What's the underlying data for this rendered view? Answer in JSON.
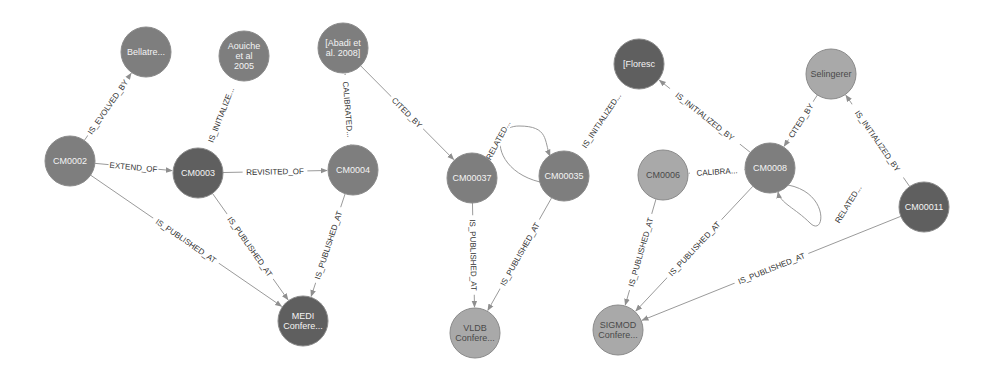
{
  "graph": {
    "colors": {
      "dark": "#5f5f5f",
      "medium": "#7e7e7e",
      "light": "#a9a9a9",
      "edge": "#9a9a9a",
      "edge_label": "#333333"
    },
    "nodes": [
      {
        "id": "n_bellatreche",
        "label_lines": [
          "Bellatre..."
        ],
        "x": 146,
        "y": 52,
        "r": 25,
        "shade": "medium"
      },
      {
        "id": "n_aouiche",
        "label_lines": [
          "Aouiche",
          "et al",
          "2005"
        ],
        "x": 244,
        "y": 56,
        "r": 25,
        "shade": "medium"
      },
      {
        "id": "n_abadi",
        "label_lines": [
          "[Abadi et",
          "al. 2008]"
        ],
        "x": 343,
        "y": 48,
        "r": 25,
        "shade": "medium"
      },
      {
        "id": "n_floresc",
        "label_lines": [
          "[Floresc"
        ],
        "x": 639,
        "y": 64,
        "r": 25,
        "shade": "dark"
      },
      {
        "id": "n_selingerer",
        "label_lines": [
          "Selingerer"
        ],
        "x": 831,
        "y": 74,
        "r": 25,
        "shade": "light"
      },
      {
        "id": "n_cm0002",
        "label_lines": [
          "CM0002"
        ],
        "x": 70,
        "y": 161,
        "r": 25,
        "shade": "medium"
      },
      {
        "id": "n_cm0003",
        "label_lines": [
          "CM0003"
        ],
        "x": 198,
        "y": 173,
        "r": 25,
        "shade": "dark"
      },
      {
        "id": "n_cm0004",
        "label_lines": [
          "CM0004"
        ],
        "x": 353,
        "y": 170,
        "r": 25,
        "shade": "medium"
      },
      {
        "id": "n_cm00037",
        "label_lines": [
          "CM00037"
        ],
        "x": 472,
        "y": 178,
        "r": 25,
        "shade": "medium"
      },
      {
        "id": "n_cm00035",
        "label_lines": [
          "CM00035"
        ],
        "x": 564,
        "y": 176,
        "r": 25,
        "shade": "medium"
      },
      {
        "id": "n_cm0006",
        "label_lines": [
          "CM0006"
        ],
        "x": 663,
        "y": 175,
        "r": 25,
        "shade": "light"
      },
      {
        "id": "n_cm0008",
        "label_lines": [
          "CM0008"
        ],
        "x": 770,
        "y": 168,
        "r": 25,
        "shade": "medium"
      },
      {
        "id": "n_cm00011",
        "label_lines": [
          "CM00011"
        ],
        "x": 924,
        "y": 207,
        "r": 25,
        "shade": "dark"
      },
      {
        "id": "n_medi",
        "label_lines": [
          "MEDI",
          "Confere..."
        ],
        "x": 303,
        "y": 321,
        "r": 25,
        "shade": "dark"
      },
      {
        "id": "n_vldb",
        "label_lines": [
          "VLDB",
          "Confere..."
        ],
        "x": 475,
        "y": 333,
        "r": 25,
        "shade": "light"
      },
      {
        "id": "n_sigmod",
        "label_lines": [
          "SIGMOD",
          "Confere..."
        ],
        "x": 618,
        "y": 330,
        "r": 25,
        "shade": "light"
      }
    ],
    "edges": [
      {
        "from": "n_cm0002",
        "to": "n_bellatreche",
        "label": "IS_EVOLVED_BY"
      },
      {
        "from": "n_cm0002",
        "to": "n_cm0003",
        "label": "EXTEND_OF"
      },
      {
        "from": "n_cm0002",
        "to": "n_medi",
        "label": "IS_PUBLISHED_AT"
      },
      {
        "from": "n_cm0003",
        "to": "n_aouiche",
        "label": "IS_INITIALIZE..."
      },
      {
        "from": "n_cm0003",
        "to": "n_cm0004",
        "label": "REVISITED_OF"
      },
      {
        "from": "n_cm0003",
        "to": "n_medi",
        "label": "IS_PUBLISHED_AT"
      },
      {
        "from": "n_cm0004",
        "to": "n_abadi",
        "label": "CALIBRATED..."
      },
      {
        "from": "n_cm0004",
        "to": "n_medi",
        "label": "IS_PUBLISHED_AT"
      },
      {
        "from": "n_abadi",
        "to": "n_cm00037",
        "label": "CITED_BY"
      },
      {
        "from": "n_cm00037",
        "to": "n_cm00035",
        "label": "RELATED...",
        "curve": "loop-over"
      },
      {
        "from": "n_cm00037",
        "to": "n_vldb",
        "label": "IS_PUBLISHED_AT"
      },
      {
        "from": "n_cm00035",
        "to": "n_floresc",
        "label": "IS_INITIALIZED..."
      },
      {
        "from": "n_cm00035",
        "to": "n_vldb",
        "label": "IS_PUBLISHED_AT"
      },
      {
        "from": "n_cm0008",
        "to": "n_floresc",
        "label": "IS_INITIALIZED_BY"
      },
      {
        "from": "n_selingerer",
        "to": "n_cm0008",
        "label": "CITED_BY"
      },
      {
        "from": "n_cm0008",
        "to": "n_cm0006",
        "label": "CALIBRA..."
      },
      {
        "from": "n_cm0008",
        "to": "n_cm0008",
        "label": "RELATED...",
        "self_loop": true
      },
      {
        "from": "n_cm0008",
        "to": "n_sigmod",
        "label": "IS_PUBLISHED_AT"
      },
      {
        "from": "n_cm0006",
        "to": "n_sigmod",
        "label": "IS_PUBLISHED_AT"
      },
      {
        "from": "n_cm00011",
        "to": "n_selingerer",
        "label": "IS_INITIALIZED_BY"
      },
      {
        "from": "n_cm00011",
        "to": "n_sigmod",
        "label": "IS_PUBLISHED_AT"
      }
    ]
  }
}
